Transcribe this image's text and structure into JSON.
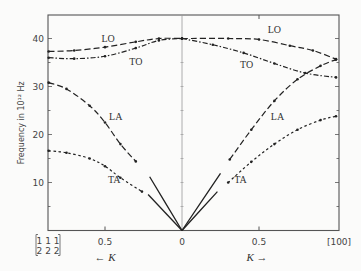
{
  "chart_data": {
    "type": "line",
    "title": "",
    "xlabel_left": "← K",
    "xlabel_right": "K →",
    "ylabel": "Frequency in 10¹² Hz",
    "ylim": [
      0,
      45
    ],
    "yticks": [
      10,
      20,
      30,
      40
    ],
    "x_left": {
      "direction": "[111]",
      "zone_boundary_label": [
        "1 1 1",
        "2 2 2"
      ],
      "zone_boundary_K": 0.866,
      "ticks": [
        {
          "K": 0.5,
          "label": "0.5"
        }
      ]
    },
    "x_center_label": "0",
    "x_right": {
      "direction": "[100]",
      "end_label": "[100]",
      "end_K": 1.0,
      "ticks": [
        {
          "K": 0.5,
          "label": "0.5"
        }
      ]
    },
    "grid": false,
    "series": [
      {
        "name": "LO",
        "branch": "left",
        "style": "dashed",
        "points": [
          [
            0.866,
            37.3
          ],
          [
            0.7,
            37.5
          ],
          [
            0.5,
            38.2
          ],
          [
            0.3,
            39.3
          ],
          [
            0.15,
            40.0
          ],
          [
            0.0,
            40.0
          ]
        ]
      },
      {
        "name": "TO",
        "branch": "left",
        "style": "dash-dot",
        "points": [
          [
            0.866,
            36.0
          ],
          [
            0.7,
            35.8
          ],
          [
            0.5,
            36.3
          ],
          [
            0.3,
            38.0
          ],
          [
            0.15,
            39.6
          ],
          [
            0.0,
            40.0
          ]
        ]
      },
      {
        "name": "LA",
        "branch": "left",
        "style": "dashed",
        "points": [
          [
            0.866,
            30.8
          ],
          [
            0.75,
            29.5
          ],
          [
            0.6,
            26.0
          ],
          [
            0.5,
            22.5
          ],
          [
            0.4,
            18.0
          ],
          [
            0.3,
            14.4
          ]
        ]
      },
      {
        "name": "TA",
        "branch": "left",
        "style": "dotted",
        "points": [
          [
            0.866,
            16.6
          ],
          [
            0.75,
            16.2
          ],
          [
            0.6,
            15.0
          ],
          [
            0.5,
            13.4
          ],
          [
            0.4,
            11.0
          ],
          [
            0.26,
            8.1
          ]
        ]
      },
      {
        "name": "LA (slope)",
        "branch": "left",
        "style": "solid",
        "points": [
          [
            0.0,
            0.0
          ],
          [
            0.21,
            11.2
          ]
        ]
      },
      {
        "name": "TA (slope)",
        "branch": "left",
        "style": "solid",
        "points": [
          [
            0.0,
            0.0
          ],
          [
            0.22,
            7.5
          ]
        ]
      },
      {
        "name": "LO",
        "branch": "right",
        "style": "dashed",
        "points": [
          [
            0.0,
            40.0
          ],
          [
            0.3,
            40.0
          ],
          [
            0.5,
            39.8
          ],
          [
            0.7,
            38.5
          ],
          [
            0.85,
            37.5
          ],
          [
            1.0,
            35.7
          ]
        ]
      },
      {
        "name": "TO",
        "branch": "right",
        "style": "dash-dot",
        "points": [
          [
            0.0,
            40.0
          ],
          [
            0.2,
            38.7
          ],
          [
            0.4,
            37.0
          ],
          [
            0.6,
            34.8
          ],
          [
            0.8,
            32.8
          ],
          [
            1.0,
            31.9
          ]
        ]
      },
      {
        "name": "LA",
        "branch": "right",
        "style": "dashed",
        "points": [
          [
            0.31,
            14.8
          ],
          [
            0.45,
            21.0
          ],
          [
            0.6,
            27.0
          ],
          [
            0.75,
            31.5
          ],
          [
            0.9,
            34.3
          ],
          [
            1.0,
            35.6
          ]
        ]
      },
      {
        "name": "TA",
        "branch": "right",
        "style": "dotted",
        "points": [
          [
            0.3,
            10.0
          ],
          [
            0.45,
            14.3
          ],
          [
            0.6,
            18.0
          ],
          [
            0.75,
            21.0
          ],
          [
            0.9,
            23.0
          ],
          [
            1.0,
            23.8
          ]
        ]
      },
      {
        "name": "LA (slope)",
        "branch": "right",
        "style": "solid",
        "points": [
          [
            0.0,
            0.0
          ],
          [
            0.25,
            11.9
          ]
        ]
      },
      {
        "name": "TA (slope)",
        "branch": "right",
        "style": "solid",
        "points": [
          [
            0.0,
            0.0
          ],
          [
            0.23,
            8.1
          ]
        ]
      }
    ],
    "annotations": [
      {
        "text": "LO",
        "branch": "left",
        "K": 0.48,
        "f": 39.3
      },
      {
        "text": "TO",
        "branch": "left",
        "K": 0.3,
        "f": 34.5
      },
      {
        "text": "LA",
        "branch": "left",
        "K": 0.43,
        "f": 23.0
      },
      {
        "text": "TA",
        "branch": "left",
        "K": 0.44,
        "f": 10.0
      },
      {
        "text": "LO",
        "branch": "right",
        "K": 0.6,
        "f": 41.2
      },
      {
        "text": "TO",
        "branch": "right",
        "K": 0.42,
        "f": 33.8
      },
      {
        "text": "LA",
        "branch": "right",
        "K": 0.62,
        "f": 23.0
      },
      {
        "text": "TA",
        "branch": "right",
        "K": 0.38,
        "f": 9.8
      }
    ]
  }
}
